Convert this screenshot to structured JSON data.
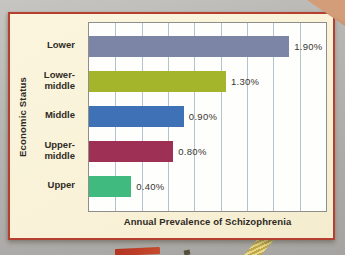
{
  "page": {
    "background_color": "#b6b5b1",
    "panel_background": "#f9f2d8",
    "panel_border_color": "#b5402f",
    "corner_surface_color": "#c0815f"
  },
  "chart_data": {
    "type": "bar",
    "orientation": "horizontal",
    "title": "",
    "xlabel": "Annual Prevalence of Schizophrenia",
    "ylabel": "Economic Status",
    "categories": [
      "Lower",
      "Lower-middle",
      "Middle",
      "Upper-middle",
      "Upper"
    ],
    "tick_labels": [
      "Lower",
      "Lower-\nmiddle",
      "Middle",
      "Upper-\nmiddle",
      "Upper"
    ],
    "values": [
      1.9,
      1.3,
      0.9,
      0.8,
      0.4
    ],
    "value_labels": [
      "1.90%",
      "1.30%",
      "0.90%",
      "0.80%",
      "0.40%"
    ],
    "unit": "percent",
    "bar_colors": [
      "#7d85a7",
      "#a4b52b",
      "#3e71b5",
      "#9e3056",
      "#41ba80"
    ],
    "xlim": [
      0,
      2.25
    ],
    "grid_step": 0.25,
    "grid": true,
    "gridline_color": "#b7c3cb",
    "legend": false
  }
}
